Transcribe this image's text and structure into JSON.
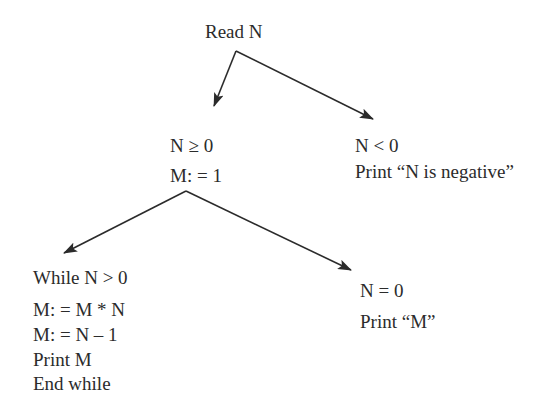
{
  "diagram": {
    "type": "decision-tree",
    "nodes": {
      "root": {
        "lines": [
          "Read N"
        ]
      },
      "nonneg": {
        "lines": [
          "N ≥ 0",
          "M: = 1"
        ]
      },
      "neg": {
        "lines": [
          "N < 0",
          "Print “N is negative”"
        ]
      },
      "loop": {
        "lines": [
          "While N > 0",
          "M: = M * N",
          "M: = N – 1",
          "Print M",
          "End while"
        ]
      },
      "zero": {
        "lines": [
          "N = 0",
          "Print “M”"
        ]
      }
    },
    "edges": [
      {
        "from": "root",
        "to": "nonneg"
      },
      {
        "from": "root",
        "to": "neg"
      },
      {
        "from": "nonneg",
        "to": "loop"
      },
      {
        "from": "nonneg",
        "to": "zero"
      }
    ],
    "colors": {
      "line": "#2b2b2b",
      "text": "#2b2b2b",
      "background": "#ffffff"
    }
  }
}
